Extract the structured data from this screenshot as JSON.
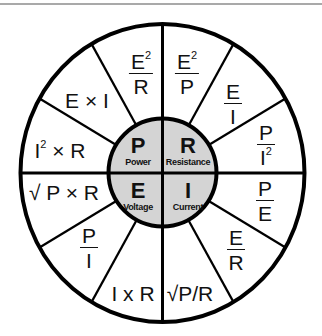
{
  "colors": {
    "inner_fill": "#d4d4d4",
    "stroke": "#000000",
    "top_rule": "#a9a9a9"
  },
  "center": {
    "power": {
      "symbol": "P",
      "label": "Power"
    },
    "resistance": {
      "symbol": "R",
      "label": "Resistance"
    },
    "voltage": {
      "symbol": "E",
      "label": "Voltage"
    },
    "current": {
      "symbol": "I",
      "label": "Current"
    }
  },
  "formulas": {
    "power": {
      "e2_over_r": {
        "num": "E",
        "num_sup": "2",
        "den": "R"
      },
      "e_times_i": "E × I",
      "i2_times_r": {
        "base": "I",
        "sup": "2",
        "rest": " × R"
      }
    },
    "resistance": {
      "e2_over_p": {
        "num": "E",
        "num_sup": "2",
        "den": "P"
      },
      "e_over_i": {
        "num": "E",
        "den": "I"
      },
      "p_over_i2": {
        "num": "P",
        "den": "I",
        "den_sup": "2"
      }
    },
    "current": {
      "p_over_e": {
        "num": "P",
        "den": "E"
      },
      "e_over_r": {
        "num": "E",
        "den": "R"
      },
      "sqrt_p_over_r": "√P/R"
    },
    "voltage": {
      "sqrt_p_times_r": "√ P × R",
      "p_over_i": {
        "num": "P",
        "den": "I"
      },
      "i_times_r": "I x R"
    }
  }
}
